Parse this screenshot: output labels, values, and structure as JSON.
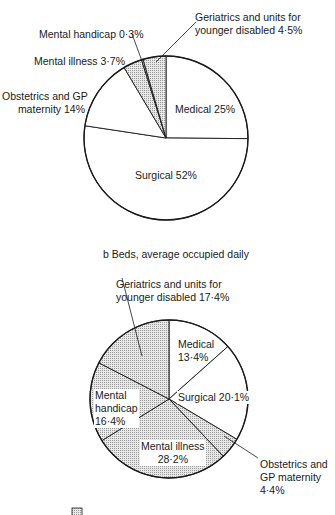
{
  "chart_data": [
    {
      "type": "pie",
      "title": "",
      "categories": [
        "Medical",
        "Surgical",
        "Obstetrics and GP maternity",
        "Mental illness",
        "Mental handicap",
        "Geriatrics and units for younger disabled"
      ],
      "values": [
        25,
        52,
        14,
        3.7,
        0.3,
        4.5
      ],
      "unit": "%",
      "shaded": [
        false,
        false,
        false,
        true,
        true,
        true
      ],
      "start_angle_deg": 0,
      "direction": "clockwise"
    },
    {
      "type": "pie",
      "title": "b  Beds, average occupied daily",
      "categories": [
        "Medical",
        "Surgical",
        "Obstetrics and GP maternity",
        "Mental illness",
        "Mental handicap",
        "Geriatrics and units for younger disabled"
      ],
      "values": [
        13.4,
        20.1,
        4.4,
        28.2,
        16.4,
        17.4
      ],
      "unit": "%",
      "shaded": [
        false,
        false,
        true,
        true,
        true,
        true
      ],
      "start_angle_deg": 0,
      "direction": "clockwise"
    }
  ],
  "pie_a": {
    "labels": {
      "medical": "Medical 25%",
      "surgical": "Surgical 52%",
      "obstetrics_1": "Obstetrics and GP",
      "obstetrics_2": "maternity 14%",
      "mental_illness": "Mental illness 3·7%",
      "mental_handicap": "Mental handicap 0·3%",
      "geriatrics_1": "Geriatrics and units for",
      "geriatrics_2": "younger disabled 4·5%"
    }
  },
  "pie_b": {
    "title": "b  Beds, average occupied daily",
    "labels": {
      "geriatrics_1": "Geriatrics and units for",
      "geriatrics_2": "younger disabled 17·4%",
      "medical_1": "Medical",
      "medical_2": "13·4%",
      "surgical": "Surgical 20·1%",
      "mental_handicap_1": "Mental",
      "mental_handicap_2": "handicap",
      "mental_handicap_3": "16·4%",
      "mental_illness_1": "Mental illness",
      "mental_illness_2": "28·2%",
      "obstetrics_1": "Obstetrics and",
      "obstetrics_2": "GP maternity",
      "obstetrics_3": "4·4%"
    }
  },
  "legend": {
    "swatch": "shaded-swatch"
  },
  "colors": {
    "line": "#1a1a1a",
    "shade": "#d4d4d4",
    "background": "#ffffff"
  }
}
